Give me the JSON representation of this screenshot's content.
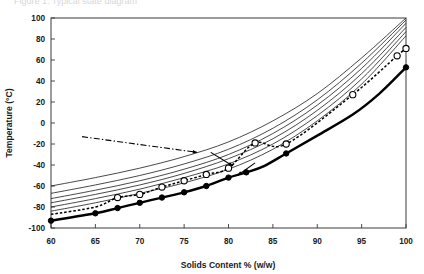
{
  "figure": {
    "background_color": "#ffffff",
    "ghost_caption": "Figure 1.  Typical state diagram"
  },
  "chart_data": {
    "type": "line",
    "title": "",
    "xlabel": "Solids Content % (w/w)",
    "ylabel": "Temperature (°C)",
    "xlim": [
      60,
      100
    ],
    "ylim": [
      -100,
      100
    ],
    "xticks": [
      60,
      65,
      70,
      75,
      80,
      85,
      90,
      95,
      100
    ],
    "yticks": [
      -100,
      -80,
      -60,
      -40,
      -20,
      0,
      20,
      40,
      60,
      80,
      100
    ],
    "xtick_labels": [
      "60",
      "65",
      "70",
      "75",
      "80",
      "85",
      "90",
      "95",
      "100"
    ],
    "ytick_labels": [
      "-100",
      "-80",
      "-60",
      "-40",
      "-20",
      "0",
      "20",
      "40",
      "60",
      "80",
      "100"
    ],
    "grid": false,
    "legend": "none",
    "accent_color": "#000000",
    "series": [
      {
        "name": "thin-curve-1",
        "style": "solid-thin",
        "marker": "none",
        "x": [
          60,
          65,
          70,
          75,
          80,
          85,
          90,
          95,
          100
        ],
        "y": [
          -60,
          -52,
          -43,
          -32,
          -18,
          2,
          28,
          62,
          100
        ]
      },
      {
        "name": "thin-curve-2",
        "style": "solid-thin",
        "marker": "none",
        "x": [
          60,
          65,
          70,
          75,
          80,
          85,
          90,
          95,
          100
        ],
        "y": [
          -67,
          -59,
          -50,
          -39,
          -25,
          -5,
          22,
          57,
          98
        ]
      },
      {
        "name": "thin-curve-3",
        "style": "solid-thin",
        "marker": "none",
        "x": [
          60,
          65,
          70,
          75,
          80,
          85,
          90,
          95,
          100
        ],
        "y": [
          -72,
          -64,
          -55,
          -44,
          -30,
          -10,
          17,
          52,
          95
        ]
      },
      {
        "name": "thin-curve-4",
        "style": "solid-thin",
        "marker": "none",
        "x": [
          60,
          65,
          70,
          75,
          80,
          85,
          90,
          95,
          100
        ],
        "y": [
          -76,
          -68,
          -59,
          -48,
          -34,
          -15,
          12,
          47,
          91
        ]
      },
      {
        "name": "thin-curve-5",
        "style": "solid-thin",
        "marker": "none",
        "x": [
          60,
          65,
          70,
          75,
          80,
          85,
          90,
          95,
          100
        ],
        "y": [
          -80,
          -72,
          -63,
          -52,
          -39,
          -20,
          7,
          42,
          87
        ]
      },
      {
        "name": "thin-curve-6",
        "style": "solid-thin",
        "marker": "none",
        "x": [
          60,
          65,
          70,
          75,
          80,
          85,
          90,
          95,
          100
        ],
        "y": [
          -84,
          -76,
          -67,
          -57,
          -44,
          -25,
          2,
          37,
          83
        ]
      },
      {
        "name": "glass-transition-open-circles",
        "style": "dashed",
        "marker": "open-circle",
        "x": [
          60,
          65,
          67.5,
          70,
          72.5,
          75,
          77.5,
          80,
          83,
          86.5,
          94,
          99,
          100
        ],
        "y": [
          -87,
          -80,
          -71,
          -68,
          -61,
          -55,
          -49,
          -43,
          -19,
          -20,
          27,
          64,
          71
        ],
        "marker_x": [
          67.5,
          70,
          72.5,
          75,
          77.5,
          80,
          83,
          86.5,
          94,
          99,
          100
        ],
        "marker_y": [
          -71,
          -68,
          -61,
          -55,
          -49,
          -43,
          -19,
          -20,
          27,
          64,
          71
        ]
      },
      {
        "name": "freezing-curve-filled-circles",
        "style": "solid-thick",
        "marker": "filled-circle",
        "x": [
          60,
          65,
          67.5,
          70,
          72.5,
          75,
          77.5,
          80,
          82,
          84,
          86.5,
          90,
          94,
          97,
          100
        ],
        "y": [
          -93,
          -86,
          -81,
          -76,
          -71,
          -66,
          -60,
          -52,
          -47,
          -41,
          -29,
          -12,
          8,
          28,
          53
        ],
        "marker_x": [
          60,
          65,
          67.5,
          70,
          72.5,
          75,
          77.5,
          80,
          82,
          86.5,
          100
        ],
        "marker_y": [
          -93,
          -86,
          -81,
          -76,
          -71,
          -66,
          -60,
          -52,
          -47,
          -29,
          53
        ]
      }
    ],
    "annotations": [
      {
        "name": "dash-dot-leader-arrow",
        "style": "dash-dot",
        "from_x": 63.5,
        "from_y": -13,
        "to_x": 76.5,
        "to_y": -28
      },
      {
        "name": "leader-arrow-to-curves",
        "style": "solid",
        "from_x": 78.0,
        "from_y": -28,
        "to_x": 80.5,
        "to_y": -41
      },
      {
        "name": "leader-arrow-to-thick-curve",
        "style": "solid",
        "from_x": 83.0,
        "from_y": -38,
        "to_x": 81.0,
        "to_y": -50
      }
    ]
  }
}
